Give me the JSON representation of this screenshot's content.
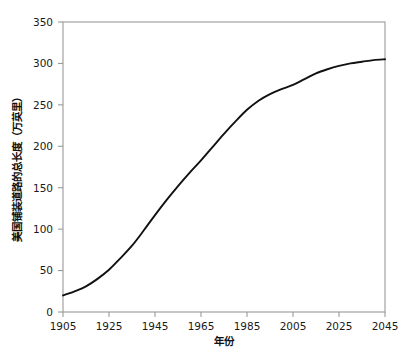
{
  "chart_data": {
    "type": "line",
    "title": "",
    "xlabel": "年份",
    "ylabel": "美国铺装道路的总长度（万英里）",
    "xlim": [
      1905,
      2045
    ],
    "ylim": [
      0,
      350
    ],
    "xticks": [
      1905,
      1925,
      1945,
      1965,
      1985,
      2005,
      2025,
      2045
    ],
    "xtick_labels": [
      "1905",
      "1925",
      "1945",
      "1965",
      "1985",
      "2005",
      "2025",
      "2045"
    ],
    "yticks": [
      0,
      50,
      100,
      150,
      200,
      250,
      300,
      350
    ],
    "ytick_labels": [
      "0",
      "50",
      "100",
      "150",
      "200",
      "250",
      "300",
      "350"
    ],
    "grid": false,
    "legend": false,
    "legend_position": "none",
    "line_color": "#111111",
    "axis_color": "#9a9a9a",
    "background_color": "#ffffff",
    "series": [
      {
        "name": "美国铺装道路的总长度",
        "color": "#111111",
        "x": [
          1905,
          1910,
          1915,
          1920,
          1925,
          1930,
          1935,
          1940,
          1945,
          1950,
          1955,
          1960,
          1965,
          1970,
          1975,
          1980,
          1985,
          1990,
          1995,
          2000,
          2005,
          2010,
          2015,
          2020,
          2025,
          2030,
          2035,
          2040,
          2045
        ],
        "values": [
          20,
          25,
          31,
          40,
          51,
          65,
          80,
          98,
          117,
          135,
          152,
          168,
          183,
          199,
          215,
          230,
          244,
          255,
          263,
          269,
          274,
          281,
          288,
          293,
          297,
          300,
          302,
          304,
          305
        ]
      }
    ]
  }
}
